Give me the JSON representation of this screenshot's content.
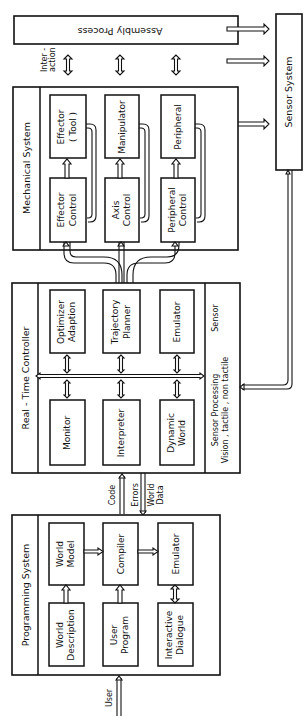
{
  "diagram": {
    "assembly_process": {
      "label": "Assembly Process"
    },
    "interaction": {
      "label_line1": "Inter -",
      "label_line2": "action"
    },
    "sensor_system": {
      "label": "Sensor System"
    },
    "mechanical_system": {
      "label": "Mechanical System",
      "effector": {
        "line1": "Effector",
        "line2": "( Tool )"
      },
      "manipulator": {
        "line1": "Manipulator"
      },
      "peripheral": {
        "line1": "Peripheral"
      },
      "effector_control": {
        "line1": "Effector",
        "line2": "Control"
      },
      "axis_control": {
        "line1": "Axis",
        "line2": "Control"
      },
      "peripheral_control": {
        "line1": "Peripheral",
        "line2": "Control"
      }
    },
    "real_time_controller": {
      "label": "Real - Time Controller",
      "optimizer": {
        "line1": "Optimizer",
        "line2": "Adaption"
      },
      "trajectory_planner": {
        "line1": "Trajectory",
        "line2": "Planner"
      },
      "emulator": {
        "line1": "Emulator"
      },
      "monitor": {
        "line1": "Monitor"
      },
      "interpreter": {
        "line1": "Interpreter"
      },
      "dynamic_world": {
        "line1": "Dynamic",
        "line2": "World"
      },
      "sensor_strip": {
        "line1": "Sensor  Processing",
        "line2": "Vision , tactile , non tactile",
        "line3": "Sensor"
      }
    },
    "links": {
      "code": "Code",
      "errors": "Errors",
      "world_data_line1": "World",
      "world_data_line2": "Data",
      "user": "User"
    },
    "programming_system": {
      "label": "Programming System",
      "world_model": {
        "line1": "World",
        "line2": "Model"
      },
      "compiler": {
        "line1": "Compiler"
      },
      "emulator": {
        "line1": "Emulator"
      },
      "world_description": {
        "line1": "World",
        "line2": "Description"
      },
      "user_program": {
        "line1": "User",
        "line2": "Program"
      },
      "interactive_dialogue": {
        "line1": "Interactive",
        "line2": "Dialogue"
      }
    }
  }
}
